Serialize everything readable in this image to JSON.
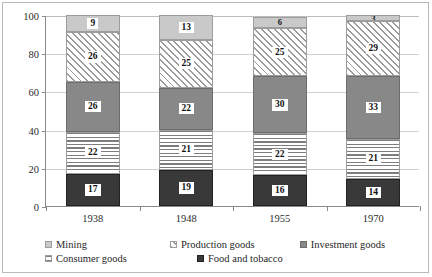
{
  "chart_data": {
    "type": "bar",
    "subtype": "stacked-bar-100-percent",
    "title": "",
    "subtitle": "",
    "xlabel": "",
    "ylabel": "",
    "categories": [
      "1938",
      "1948",
      "1955",
      "1970"
    ],
    "ylim": [
      0,
      100
    ],
    "yticks": [
      0,
      20,
      40,
      60,
      80,
      100
    ],
    "ytick_labels": [
      "0",
      "20",
      "40",
      "60",
      "80",
      "100"
    ],
    "grid": true,
    "grid_axis": "y",
    "legend_position": "bottom",
    "stack_order_bottom_to_top": [
      "Food and tobacco",
      "Consumer goods",
      "Investment goods",
      "Production goods",
      "Mining"
    ],
    "series": [
      {
        "name": "Food and tobacco",
        "pattern": "solid-dark",
        "color": "#393939",
        "values": [
          17,
          19,
          16,
          14
        ]
      },
      {
        "name": "Consumer goods",
        "pattern": "horizontal-lines",
        "color": "#7e7e7e",
        "values": [
          22,
          21,
          22,
          21
        ]
      },
      {
        "name": "Investment goods",
        "pattern": "solid-gray",
        "color": "#888888",
        "values": [
          26,
          22,
          30,
          33
        ]
      },
      {
        "name": "Production goods",
        "pattern": "diagonal-hatch",
        "color": "#9a9a9a",
        "values": [
          26,
          25,
          25,
          29
        ]
      },
      {
        "name": "Mining",
        "pattern": "solid-light-gray",
        "color": "#c9c9c9",
        "values": [
          9,
          13,
          6,
          3
        ]
      }
    ],
    "bar_labels": {
      "1938": {
        "Food and tobacco": "17",
        "Consumer goods": "22",
        "Investment goods": "26",
        "Production goods": "26",
        "Mining": "9"
      },
      "1948": {
        "Food and tobacco": "19",
        "Consumer goods": "21",
        "Investment goods": "22",
        "Production goods": "25",
        "Mining": "13"
      },
      "1955": {
        "Food and tobacco": "16",
        "Consumer goods": "22",
        "Investment goods": "30",
        "Production goods": "25",
        "Mining": "6"
      },
      "1970": {
        "Food and tobacco": "14",
        "Consumer goods": "21",
        "Investment goods": "33",
        "Production goods": "29",
        "Mining": "3"
      }
    }
  },
  "axis": {
    "y_ticks": [
      {
        "value": 100,
        "label": "100"
      },
      {
        "value": 80,
        "label": "80"
      },
      {
        "value": 60,
        "label": "60"
      },
      {
        "value": 40,
        "label": "40"
      },
      {
        "value": 20,
        "label": "20"
      },
      {
        "value": 0,
        "label": "0"
      }
    ],
    "x_labels": [
      "1938",
      "1948",
      "1955",
      "1970"
    ]
  },
  "legend": {
    "row1": [
      {
        "label": "Mining",
        "swatch": "mining-swatch"
      },
      {
        "label": "Production goods",
        "swatch": "production-goods-swatch"
      },
      {
        "label": "Investment goods",
        "swatch": "investment-goods-swatch"
      }
    ],
    "row2": [
      {
        "label": "Consumer goods",
        "swatch": "consumer-goods-swatch"
      },
      {
        "label": "Food and tobacco",
        "swatch": "food-and-tobacco-swatch"
      }
    ]
  },
  "colors": {
    "mining": "#c9c9c9",
    "production_goods": "#9a9a9a",
    "investment_goods": "#888888",
    "consumer_goods": "#7e7e7e",
    "food_and_tobacco": "#393939",
    "axis": "#8a8a8a",
    "grid": "#d0d0d0",
    "frame": "#b9b9b9"
  }
}
